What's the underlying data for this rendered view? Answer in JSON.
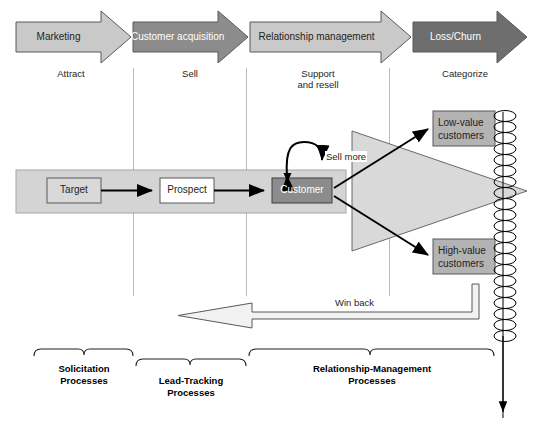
{
  "diagram": {
    "phases": [
      {
        "label": "Marketing",
        "sublabel": "Attract",
        "fill": "#c9c9c9"
      },
      {
        "label": "Customer acquisition",
        "sublabel": "Sell",
        "fill": "#8c8c8c"
      },
      {
        "label": "Relationship management",
        "sublabel": "Support\nand resell",
        "fill": "#c9c9c9"
      },
      {
        "label": "Loss/Churn",
        "sublabel": "Categorize",
        "fill": "#6e6e6e"
      }
    ],
    "phase_sub_lines": [
      [
        "Attract"
      ],
      [
        "Sell"
      ],
      [
        "Support",
        "and resell"
      ],
      [
        "Categorize"
      ]
    ],
    "flow_boxes": [
      {
        "label": "Target",
        "fill": "#d9d9d9"
      },
      {
        "label": "Prospect",
        "fill": "#ffffff"
      },
      {
        "label": "Customer",
        "fill": "#8c8c8c"
      }
    ],
    "loop_label": "Sell more",
    "outcome_boxes": [
      {
        "label_line1": "Low-value",
        "label_line2": "customers",
        "fill": "#b3b3b3"
      },
      {
        "label_line1": "High-value",
        "label_line2": "customers",
        "fill": "#b3b3b3"
      }
    ],
    "winback_label": "Win back",
    "brackets": [
      {
        "lines": [
          "Solicitation",
          "Processes"
        ]
      },
      {
        "lines": [
          "Lead-Tracking",
          "Processes"
        ]
      },
      {
        "lines": [
          "Relationship-Management",
          "Processes"
        ]
      }
    ],
    "colors": {
      "band_fill": "#d4d4d4",
      "wedge_fill": "#d9d9d9",
      "stroke": "#58595b",
      "dark_stroke": "#000000",
      "divider": "#b9b9b9",
      "text": "#231f20"
    }
  }
}
